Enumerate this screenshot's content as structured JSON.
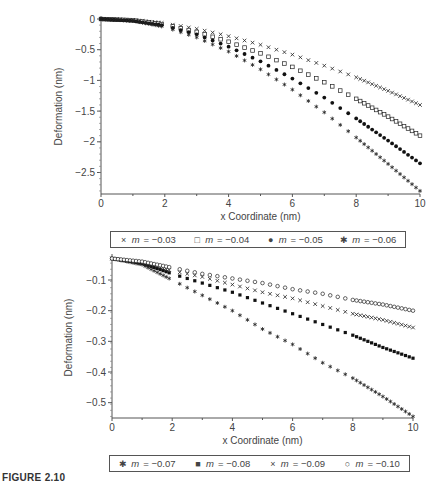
{
  "caption": "FIGURE 2.10",
  "chart_data": [
    {
      "type": "scatter",
      "title": "",
      "xlabel": "x Coordinate (nm)",
      "ylabel": "Deformation (nm)",
      "xlim": [
        0,
        10
      ],
      "ylim": [
        -2.85,
        0
      ],
      "xticks": [
        0,
        2,
        4,
        6,
        8,
        10
      ],
      "yticks": [
        0,
        -0.5,
        -1,
        -1.5,
        -2,
        -2.5
      ],
      "ytick_labels": [
        "0",
        "−0.5",
        "−1",
        "−1.5",
        "−2",
        "−2.5"
      ],
      "grid": false,
      "legend_position": "below",
      "x": [
        0,
        1,
        2,
        3,
        4,
        5,
        6,
        7,
        8,
        9,
        10
      ],
      "series": [
        {
          "name": "m = −0.03",
          "marker": "x",
          "values": [
            0,
            -0.02,
            -0.07,
            -0.16,
            -0.28,
            -0.42,
            -0.58,
            -0.76,
            -0.95,
            -1.17,
            -1.4
          ]
        },
        {
          "name": "m = −0.04",
          "marker": "open-square",
          "values": [
            0,
            -0.02,
            -0.09,
            -0.21,
            -0.37,
            -0.56,
            -0.78,
            -1.03,
            -1.3,
            -1.59,
            -1.9
          ]
        },
        {
          "name": "m = −0.05",
          "marker": "filled-circle",
          "values": [
            0,
            -0.03,
            -0.11,
            -0.25,
            -0.45,
            -0.69,
            -0.97,
            -1.28,
            -1.62,
            -1.98,
            -2.35
          ]
        },
        {
          "name": "m = −0.06",
          "marker": "star",
          "values": [
            0,
            -0.03,
            -0.13,
            -0.3,
            -0.53,
            -0.82,
            -1.15,
            -1.52,
            -1.93,
            -2.36,
            -2.8
          ]
        }
      ]
    },
    {
      "type": "scatter",
      "title": "",
      "xlabel": "x Coordinate (nm)",
      "ylabel": "Deformation (nm)",
      "xlim": [
        0,
        10
      ],
      "ylim": [
        -0.55,
        -0.025
      ],
      "xticks": [
        0,
        2,
        4,
        6,
        8,
        10
      ],
      "yticks": [
        -0.1,
        -0.2,
        -0.3,
        -0.4,
        -0.5
      ],
      "ytick_labels": [
        "−0.1",
        "−0.2",
        "−0.3",
        "−0.4",
        "−0.5"
      ],
      "grid": false,
      "legend_position": "below",
      "x": [
        0,
        1,
        2,
        3,
        4,
        5,
        6,
        7,
        8,
        9,
        10
      ],
      "series": [
        {
          "name": "m = −0.07",
          "marker": "star",
          "values": [
            -0.03,
            -0.05,
            -0.1,
            -0.15,
            -0.2,
            -0.26,
            -0.31,
            -0.37,
            -0.42,
            -0.48,
            -0.545
          ]
        },
        {
          "name": "m = −0.08",
          "marker": "filled-square",
          "values": [
            -0.03,
            -0.045,
            -0.08,
            -0.11,
            -0.14,
            -0.175,
            -0.21,
            -0.245,
            -0.28,
            -0.32,
            -0.355
          ]
        },
        {
          "name": "m = −0.09",
          "marker": "x",
          "values": [
            -0.03,
            -0.045,
            -0.07,
            -0.09,
            -0.115,
            -0.14,
            -0.16,
            -0.185,
            -0.21,
            -0.23,
            -0.255
          ]
        },
        {
          "name": "m = −0.10",
          "marker": "open-circle",
          "values": [
            -0.03,
            -0.04,
            -0.06,
            -0.08,
            -0.095,
            -0.11,
            -0.13,
            -0.145,
            -0.165,
            -0.18,
            -0.2
          ]
        }
      ]
    }
  ],
  "legend_top": [
    {
      "symbol": "×",
      "prefix": "m",
      "value": " = −0.03"
    },
    {
      "symbol": "□",
      "prefix": "m",
      "value": " = −0.04"
    },
    {
      "symbol": "●",
      "prefix": "m",
      "value": " = −0.05"
    },
    {
      "symbol": "✱",
      "prefix": "m",
      "value": " = −0.06"
    }
  ],
  "legend_bottom": [
    {
      "symbol": "✱",
      "prefix": "m",
      "value": " = −0.07"
    },
    {
      "symbol": "■",
      "prefix": "m",
      "value": " = −0.08"
    },
    {
      "symbol": "×",
      "prefix": "m",
      "value": " = −0.09"
    },
    {
      "symbol": "○",
      "prefix": "m",
      "value": " = −0.10"
    }
  ]
}
